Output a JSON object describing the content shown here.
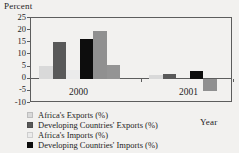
{
  "chart_data": {
    "type": "bar",
    "title": "",
    "ylabel": "Percent",
    "xlabel": "Year",
    "categories": [
      "2000",
      "2001"
    ],
    "ylim": [
      -10,
      25
    ],
    "yticks": [
      25,
      20,
      15,
      10,
      5,
      0,
      -5,
      -10
    ],
    "grid": false,
    "legend_position": "bottom-left",
    "series": [
      {
        "name": "Africa's Exports (%)",
        "color": "#d9d9d9",
        "values": [
          5.3,
          1.6
        ]
      },
      {
        "name": "Developing Countries' Exports (%)",
        "color": "#595959",
        "values": [
          15.2,
          2.1
        ]
      },
      {
        "name": "Africa's Imports (%)",
        "color": "#ebebeb",
        "values": [
          3.7,
          0.0
        ]
      },
      {
        "name": "Developing Countries' Imports (%)",
        "color": "#0d0d0d",
        "values": [
          16.4,
          3.2
        ]
      },
      {
        "name": "unlabeled-series-5",
        "color": "#909090",
        "values": [
          19.7,
          -5.0
        ]
      },
      {
        "name": "unlabeled-series-6",
        "color": "#949494",
        "values": [
          5.5,
          0.0
        ]
      }
    ]
  },
  "legend": {
    "items": [
      {
        "label": "Africa's Exports (%)",
        "color": "#d9d9d9"
      },
      {
        "label": "Developing Countries' Exports (%)",
        "color": "#595959"
      },
      {
        "label": "Africa's Imports (%)",
        "color": "#ebebeb"
      },
      {
        "label": "Developing Countries' Imports (%)",
        "color": "#0d0d0d"
      }
    ]
  },
  "axis": {
    "y_title": "Percent",
    "x_title": "Year",
    "ytick_labels": [
      "25",
      "20",
      "15",
      "10",
      "5",
      "0",
      "-5",
      "-10"
    ],
    "xtick_labels": [
      "2000",
      "2001"
    ]
  }
}
